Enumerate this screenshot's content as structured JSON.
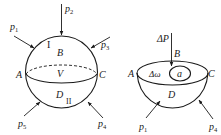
{
  "figure_left": {
    "title": "sphere-under-forces",
    "labels": {
      "p1": {
        "base": "p",
        "sub": "1"
      },
      "p2": {
        "base": "p",
        "sub": "2"
      },
      "p3": {
        "base": "p",
        "sub": "3"
      },
      "p4": {
        "base": "p",
        "sub": "4"
      },
      "p5": {
        "base": "p",
        "sub": "5"
      },
      "A": "A",
      "B": "B",
      "C": "C",
      "D": "D",
      "V": "V",
      "region_I": "I",
      "region_II": "II"
    }
  },
  "figure_right": {
    "title": "hemisphere-section",
    "labels": {
      "dP": "ΔP",
      "A": "A",
      "B": "B",
      "C": "C",
      "D": "D",
      "dOmega": "Δω",
      "a": "a",
      "p1": {
        "base": "p",
        "sub": "1"
      },
      "p4": {
        "base": "p",
        "sub": "4"
      }
    }
  },
  "colors": {
    "ink": "#1a1a1a",
    "background": "#ffffff"
  }
}
